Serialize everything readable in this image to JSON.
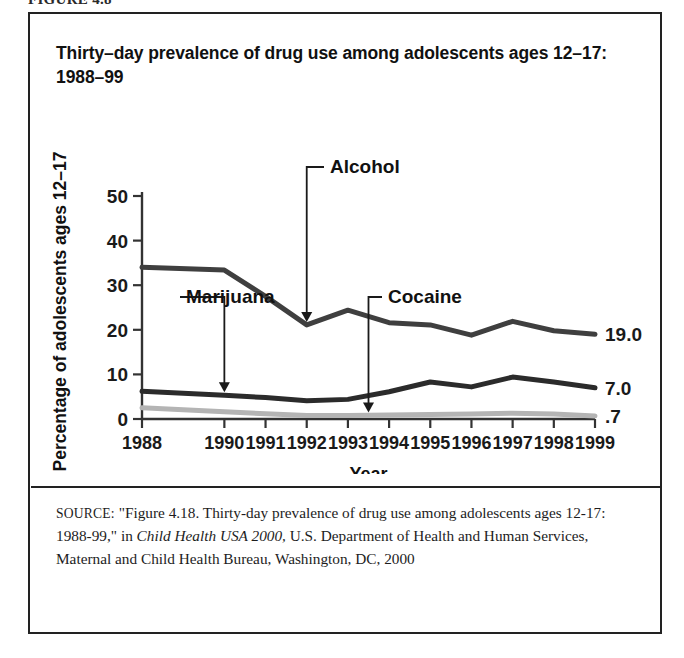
{
  "figure_caption": "FIGURE 4.8",
  "chart_title": "Thirty–day prevalence of drug use among adolescents ages 12–17: 1988–99",
  "source": {
    "label": "SOURCE:",
    "text_before_italic": " \"Figure 4.18. Thirty-day prevalence of drug use among adolescents ages 12-17: 1988-99,\" in ",
    "italic_title": "Child Health USA 2000,",
    "text_after_italic": " U.S. Department of Health and Human Services, Maternal and Child Health Bureau, Washington, DC, 2000"
  },
  "chart_data": {
    "type": "line",
    "title": "Thirty–day prevalence of drug use among adolescents ages 12–17: 1988–99",
    "xlabel": "Year",
    "ylabel": "Percentage of adolescents ages 12–17",
    "grid": false,
    "legend_position": "inline-annotations",
    "ylim": [
      0,
      50
    ],
    "yticks": [
      0,
      10,
      20,
      30,
      40,
      50
    ],
    "ytick_labels": [
      "0",
      "10",
      "20",
      "30",
      "40",
      "50"
    ],
    "x": [
      1988,
      1990,
      1991,
      1992,
      1993,
      1994,
      1995,
      1996,
      1997,
      1998,
      1999
    ],
    "xtick_labels": [
      "1988",
      "1990",
      "1991",
      "1992",
      "1993",
      "1994",
      "1995",
      "1996",
      "1997",
      "1998",
      "1999"
    ],
    "series": [
      {
        "name": "Alcohol",
        "color": "#3f3f3f",
        "line_width": 5,
        "values": [
          34.0,
          33.4,
          27.5,
          21.1,
          24.4,
          21.6,
          21.1,
          18.8,
          21.9,
          19.8,
          19.0
        ],
        "end_label": "19.0"
      },
      {
        "name": "Marijuana",
        "color": "#2b2b2b",
        "line_width": 5,
        "values": [
          6.2,
          5.3,
          4.8,
          4.1,
          4.4,
          6.1,
          8.3,
          7.2,
          9.4,
          8.3,
          7.0
        ],
        "end_label": "7.0"
      },
      {
        "name": "Cocaine",
        "color": "#b4b4b4",
        "line_width": 5,
        "values": [
          2.5,
          1.6,
          1.2,
          0.8,
          0.8,
          0.9,
          1.0,
          1.1,
          1.3,
          1.1,
          0.7
        ],
        "end_label": ".7"
      }
    ],
    "annotations": [
      {
        "label": "Alcohol",
        "target_year": 1992,
        "target_value": 21.1
      },
      {
        "label": "Marijuana",
        "target_year": 1990,
        "target_value": 5.3
      },
      {
        "label": "Cocaine",
        "target_year": 1993.5,
        "target_value": 0.8
      }
    ]
  }
}
